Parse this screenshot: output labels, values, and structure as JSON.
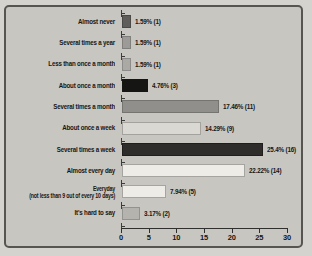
{
  "chart_data": {
    "type": "bar",
    "orientation": "horizontal",
    "title": "",
    "xlabel": "",
    "ylabel": "",
    "xlim": [
      0,
      30
    ],
    "grid": false,
    "legend": null,
    "categories": [
      "Almost never",
      "Several times a year",
      "Less than once a month",
      "About once a month",
      "Several times a month",
      "About once a week",
      "Several times a week",
      "Almost every day",
      "Everyday\n(not less than 9 out of every 10 days)",
      "It's hard to say"
    ],
    "values": [
      1.59,
      1.59,
      1.59,
      4.76,
      17.46,
      14.29,
      25.4,
      22.22,
      7.94,
      3.17
    ],
    "counts": [
      1,
      1,
      1,
      3,
      11,
      9,
      16,
      14,
      5,
      2
    ],
    "value_labels": [
      "1.59% (1)",
      "1.59% (1)",
      "1.59% (1)",
      "4.76% (3)",
      "17.46% (11)",
      "14.29% (9)",
      "25.4% (16)",
      "22.22% (14)",
      "7.94% (5)",
      "3.17% (2)"
    ],
    "bar_colors": [
      "#5f5e5a",
      "#9c9b97",
      "#aaa9a5",
      "#151513",
      "#908f8b",
      "#d9d8d3",
      "#2e2d2b",
      "#edece7",
      "#edece7",
      "#b4b3ae"
    ],
    "bar_border_colors": [
      "#4a4946",
      "#807f7b",
      "#8d8c88",
      "#151513",
      "#757470",
      "#a3a29d",
      "#1f1e1c",
      "#a5a49f",
      "#a5a49f",
      "#93928e"
    ],
    "x_tick_values": [
      0,
      5,
      10,
      15,
      20,
      25,
      30
    ],
    "x_tick_labels": [
      "0",
      "5",
      "10",
      "15",
      "20",
      "25",
      "30"
    ]
  },
  "frame": {
    "background": "#c8c6c1",
    "border_color": "#57554f",
    "page_background": "#d5d3ce",
    "text_color": "#161614"
  }
}
